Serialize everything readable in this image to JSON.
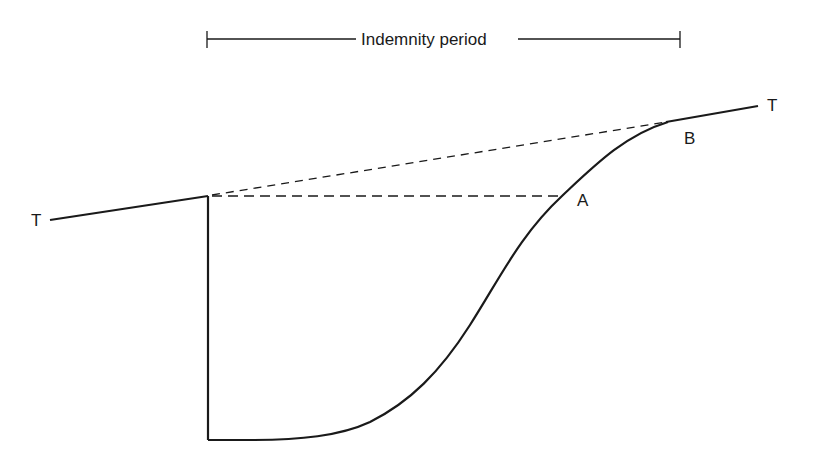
{
  "diagram": {
    "title": "Indemnity period",
    "labels": {
      "trend_left": "T",
      "trend_right": "T",
      "point_a": "A",
      "point_b": "B"
    },
    "colors": {
      "line": "#1a1a1a",
      "background": "#ffffff"
    },
    "elements": [
      {
        "name": "indemnity-period-bracket",
        "type": "dimension-line",
        "from": [
          207,
          39
        ],
        "to": [
          680,
          39
        ]
      },
      {
        "name": "trend-line-left",
        "type": "solid-line",
        "from": [
          50,
          220
        ],
        "to": [
          208,
          196
        ]
      },
      {
        "name": "drop-line",
        "type": "solid-line",
        "from": [
          208,
          196
        ],
        "to": [
          208,
          440
        ]
      },
      {
        "name": "recovery-curve",
        "type": "solid-curve",
        "from": [
          208,
          440
        ],
        "to": [
          668,
          122
        ]
      },
      {
        "name": "trend-line-right",
        "type": "solid-line",
        "from": [
          668,
          122
        ],
        "to": [
          758,
          106
        ]
      },
      {
        "name": "projected-trend-dashed",
        "type": "dashed-line",
        "from": [
          208,
          196
        ],
        "to": [
          668,
          122
        ]
      },
      {
        "name": "pre-loss-level-dashed",
        "type": "dashed-line",
        "from": [
          208,
          196
        ],
        "to": [
          562,
          196
        ]
      }
    ]
  }
}
